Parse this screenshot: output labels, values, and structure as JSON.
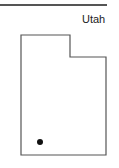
{
  "map": {
    "title": "Utah",
    "state_name": "Utah",
    "outline_color": "#555555",
    "marker_color": "#111111",
    "marker": {
      "label": "location-marker",
      "x": 40,
      "y": 142
    }
  }
}
